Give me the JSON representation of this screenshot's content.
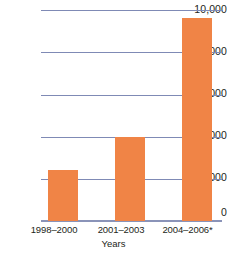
{
  "chart_data": {
    "type": "bar",
    "title": "",
    "xlabel": "Years",
    "ylabel": "",
    "categories": [
      "1998–2000",
      "2001–2003",
      "2004–2006*"
    ],
    "values": [
      2400,
      4000,
      9600
    ],
    "ylim": [
      0,
      10000
    ],
    "yticks": [
      0,
      2000,
      4000,
      6000,
      8000,
      10000
    ],
    "ytick_labels": [
      "0",
      "2,000",
      "4,000",
      "6,000",
      "8,000",
      "10,000"
    ],
    "grid": true,
    "legend": "none",
    "series": [
      {
        "name": "",
        "values": [
          2400,
          4000,
          9600
        ]
      }
    ],
    "colors": {
      "bar": "#f08446",
      "gridline": "#7f8ab5",
      "axis": "#8a93b8",
      "text": "#231f20",
      "background": "#ffffff"
    }
  }
}
